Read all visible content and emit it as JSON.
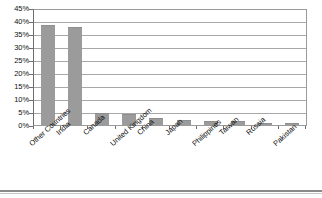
{
  "chart_data": {
    "type": "bar",
    "title": "",
    "xlabel": "",
    "ylabel": "",
    "ylim": [
      0,
      45
    ],
    "ytick_step": 5,
    "grid": true,
    "legend": "none",
    "bar_color": "#9b9b9b",
    "categories": [
      "Other Countries",
      "India",
      "Canada",
      "United Kingdom",
      "China",
      "Japan",
      "Philippines",
      "Taiwan",
      "Russia",
      "Pakistan"
    ],
    "values": [
      39,
      38,
      5,
      4.5,
      3,
      2.5,
      2,
      1.8,
      1,
      1
    ],
    "ytick_labels": [
      "45%",
      "40%",
      "35%",
      "30%",
      "25%",
      "20%",
      "15%",
      "10%",
      "5%",
      "0%"
    ],
    "ytick_values": [
      45,
      40,
      35,
      30,
      25,
      20,
      15,
      10,
      5,
      0
    ]
  }
}
